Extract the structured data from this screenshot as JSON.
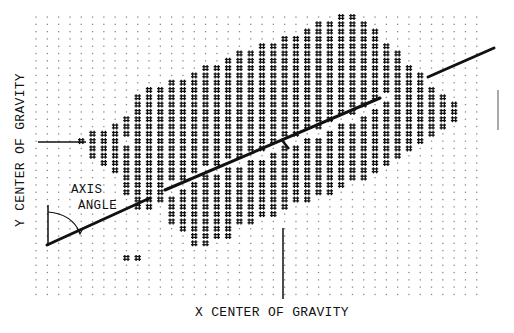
{
  "figure": {
    "type": "centroid-and-principal-axis diagram on dot-matrix printout",
    "labels": {
      "y_center": "Y CENTER OF GRAVITY",
      "x_center": "X CENTER OF GRAVITY",
      "axis_angle_line1": "AXIS",
      "axis_angle_line2": "ANGLE"
    },
    "colors": {
      "ink": "#111111",
      "dot": "#8a8a8a",
      "background": "#ffffff"
    },
    "grid": {
      "x0": 36,
      "dx": 11.3,
      "cols": 40,
      "y0": 17,
      "dy": 7.3,
      "rows": 40,
      "dot_glyph": ".",
      "fill_glyph": "#"
    },
    "blob_columns": [
      {
        "col": 4,
        "ranges": [
          [
            17,
            17
          ]
        ]
      },
      {
        "col": 5,
        "ranges": [
          [
            16,
            19
          ]
        ]
      },
      {
        "col": 6,
        "ranges": [
          [
            16,
            20
          ]
        ]
      },
      {
        "col": 7,
        "ranges": [
          [
            15,
            21
          ]
        ]
      },
      {
        "col": 8,
        "ranges": [
          [
            14,
            16
          ],
          [
            18,
            24
          ]
        ]
      },
      {
        "col": 9,
        "ranges": [
          [
            11,
            26
          ]
        ]
      },
      {
        "col": 10,
        "ranges": [
          [
            10,
            26
          ]
        ]
      },
      {
        "col": 11,
        "ranges": [
          [
            10,
            25
          ]
        ]
      },
      {
        "col": 12,
        "ranges": [
          [
            9,
            22
          ],
          [
            25,
            28
          ]
        ]
      },
      {
        "col": 13,
        "ranges": [
          [
            9,
            22
          ],
          [
            24,
            29
          ]
        ]
      },
      {
        "col": 14,
        "ranges": [
          [
            8,
            21
          ],
          [
            23,
            31
          ]
        ]
      },
      {
        "col": 15,
        "ranges": [
          [
            7,
            20
          ],
          [
            22,
            31
          ]
        ]
      },
      {
        "col": 16,
        "ranges": [
          [
            7,
            20
          ],
          [
            22,
            30
          ]
        ]
      },
      {
        "col": 17,
        "ranges": [
          [
            6,
            19
          ],
          [
            21,
            30
          ]
        ]
      },
      {
        "col": 18,
        "ranges": [
          [
            5,
            19
          ],
          [
            21,
            28
          ]
        ]
      },
      {
        "col": 19,
        "ranges": [
          [
            5,
            18
          ],
          [
            20,
            28
          ]
        ]
      },
      {
        "col": 20,
        "ranges": [
          [
            4,
            18
          ],
          [
            20,
            27
          ]
        ]
      },
      {
        "col": 21,
        "ranges": [
          [
            4,
            17
          ],
          [
            19,
            27
          ]
        ]
      },
      {
        "col": 22,
        "ranges": [
          [
            3,
            16
          ],
          [
            18,
            26
          ]
        ]
      },
      {
        "col": 23,
        "ranges": [
          [
            3,
            16
          ],
          [
            18,
            25
          ]
        ]
      },
      {
        "col": 24,
        "ranges": [
          [
            2,
            15
          ],
          [
            17,
            25
          ]
        ]
      },
      {
        "col": 25,
        "ranges": [
          [
            1,
            15
          ],
          [
            17,
            24
          ]
        ]
      },
      {
        "col": 26,
        "ranges": [
          [
            1,
            14
          ],
          [
            16,
            24
          ]
        ]
      },
      {
        "col": 27,
        "ranges": [
          [
            0,
            13
          ],
          [
            15,
            23
          ]
        ]
      },
      {
        "col": 28,
        "ranges": [
          [
            0,
            13
          ],
          [
            15,
            22
          ]
        ]
      },
      {
        "col": 29,
        "ranges": [
          [
            1,
            12
          ],
          [
            14,
            22
          ]
        ]
      },
      {
        "col": 30,
        "ranges": [
          [
            2,
            11
          ],
          [
            13,
            21
          ]
        ]
      },
      {
        "col": 31,
        "ranges": [
          [
            4,
            10
          ],
          [
            12,
            20
          ]
        ]
      },
      {
        "col": 32,
        "ranges": [
          [
            5,
            19
          ]
        ]
      },
      {
        "col": 33,
        "ranges": [
          [
            7,
            18
          ]
        ]
      },
      {
        "col": 34,
        "ranges": [
          [
            8,
            17
          ]
        ]
      },
      {
        "col": 35,
        "ranges": [
          [
            10,
            16
          ]
        ]
      },
      {
        "col": 36,
        "ranges": [
          [
            11,
            15
          ]
        ]
      },
      {
        "col": 37,
        "ranges": [
          [
            12,
            14
          ]
        ]
      }
    ],
    "stray_marks": [
      {
        "col": 8,
        "row": 33
      },
      {
        "col": 9,
        "row": 33
      }
    ],
    "principal_axis": {
      "segments": [
        {
          "x1": 47,
          "y1": 245,
          "x2": 150,
          "y2": 198
        },
        {
          "x1": 165,
          "y1": 190,
          "x2": 380,
          "y2": 98
        },
        {
          "x1": 428,
          "y1": 77,
          "x2": 494,
          "y2": 48
        }
      ]
    },
    "centroid": {
      "x": 285,
      "y": 144
    },
    "y_center_marker": {
      "x1": 38,
      "y1": 142,
      "x2": 86,
      "y2": 142
    },
    "x_center_marker": {
      "x1": 283,
      "y1": 228,
      "x2": 283,
      "y2": 299
    },
    "axis_angle": {
      "vertical": {
        "x1": 48,
        "y1": 205,
        "x2": 48,
        "y2": 246
      },
      "arc": "M 48 212 Q 72 214 80 233"
    },
    "right_edge_tick": {
      "x1": 498,
      "y1": 90,
      "x2": 498,
      "y2": 130
    }
  }
}
